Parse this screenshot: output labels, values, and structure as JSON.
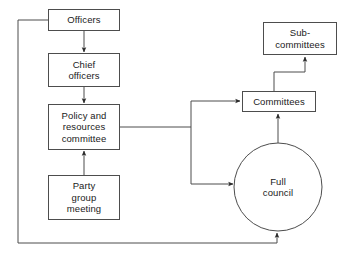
{
  "diagram": {
    "type": "flowchart",
    "canvas": {
      "width": 352,
      "height": 263
    },
    "style": {
      "background_color": "#ffffff",
      "stroke_color": "#4d4d4d",
      "node_fill_color": "#ffffff",
      "text_color": "#1a1a1a"
    },
    "nodes": [
      {
        "id": "officers",
        "label": "Officers",
        "shape": "rectangle",
        "x": 48,
        "y": 9,
        "width": 72,
        "height": 22
      },
      {
        "id": "chief-officers",
        "label": "Chief\nofficers",
        "shape": "rectangle",
        "x": 48,
        "y": 53,
        "width": 72,
        "height": 34
      },
      {
        "id": "policy-and-resources-committee",
        "label": "Policy and\nresources\ncommittee",
        "shape": "rectangle",
        "x": 48,
        "y": 104,
        "width": 72,
        "height": 46
      },
      {
        "id": "party-group-meeting",
        "label": "Party\ngroup\nmeeting",
        "shape": "rectangle",
        "x": 48,
        "y": 175,
        "width": 72,
        "height": 45
      },
      {
        "id": "committees",
        "label": "Committees",
        "shape": "rectangle",
        "x": 242,
        "y": 91,
        "width": 74,
        "height": 21
      },
      {
        "id": "sub-committees",
        "label": "Sub-\ncommittees",
        "shape": "rectangle",
        "x": 263,
        "y": 22,
        "width": 74,
        "height": 33
      },
      {
        "id": "full-council",
        "label": "Full\ncouncil",
        "shape": "circle",
        "x": 234,
        "y": 143,
        "width": 88,
        "height": 88
      }
    ],
    "edges": [
      {
        "id": "officers-to-chief-officers",
        "from": "officers",
        "to": "chief-officers",
        "arrow": true
      },
      {
        "id": "chief-officers-to-policy",
        "from": "chief-officers",
        "to": "policy-and-resources-committee",
        "arrow": true
      },
      {
        "id": "party-group-meeting-to-policy",
        "from": "party-group-meeting",
        "to": "policy-and-resources-committee",
        "arrow": true
      },
      {
        "id": "policy-to-committees",
        "from": "policy-and-resources-committee",
        "to": "committees",
        "arrow": true
      },
      {
        "id": "policy-to-full-council",
        "from": "policy-and-resources-committee",
        "to": "full-council",
        "arrow": true
      },
      {
        "id": "committees-to-sub-committees",
        "from": "committees",
        "to": "sub-committees",
        "arrow": true
      },
      {
        "id": "full-council-to-committees",
        "from": "full-council",
        "to": "committees",
        "arrow": true
      },
      {
        "id": "officers-feedback-to-full-council",
        "from": "officers",
        "to": "full-council",
        "arrow": true
      }
    ]
  }
}
